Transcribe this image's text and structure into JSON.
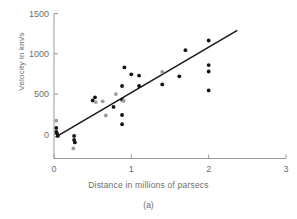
{
  "figure": {
    "caption": "(a)",
    "xlabel": "Distance in millions of parsecs",
    "ylabel": "Velocity in km/s"
  },
  "chart_data": {
    "type": "scatter",
    "title": "",
    "xlabel": "Distance in millions of parsecs",
    "ylabel": "Velocity in km/s",
    "xlim": [
      0,
      3
    ],
    "ylim": [
      -300,
      1500
    ],
    "xticks": [
      0,
      1,
      2,
      3
    ],
    "xticklabels": [
      "0",
      "1",
      "2",
      "3"
    ],
    "yticks": [
      0,
      500,
      1000,
      1500
    ],
    "yticklabels": [
      "0",
      "500",
      "1000",
      "1500"
    ],
    "grid": false,
    "legend": null,
    "axis_color": "#999999",
    "point_color": "#111111",
    "point_color_light": "#9a9a9a",
    "line_color": "#1a1a1a",
    "points": [
      {
        "x": 0.03,
        "y": 170,
        "shade": "light"
      },
      {
        "x": 0.03,
        "y": 80,
        "shade": "dark"
      },
      {
        "x": 0.03,
        "y": 30,
        "shade": "dark"
      },
      {
        "x": 0.04,
        "y": 10,
        "shade": "dark"
      },
      {
        "x": 0.05,
        "y": -20,
        "shade": "dark"
      },
      {
        "x": 0.26,
        "y": -20,
        "shade": "dark"
      },
      {
        "x": 0.26,
        "y": -70,
        "shade": "dark"
      },
      {
        "x": 0.27,
        "y": -100,
        "shade": "dark"
      },
      {
        "x": 0.25,
        "y": -175,
        "shade": "light"
      },
      {
        "x": 0.5,
        "y": 420,
        "shade": "dark"
      },
      {
        "x": 0.53,
        "y": 460,
        "shade": "dark"
      },
      {
        "x": 0.54,
        "y": 400,
        "shade": "light"
      },
      {
        "x": 0.63,
        "y": 410,
        "shade": "light"
      },
      {
        "x": 0.67,
        "y": 235,
        "shade": "light"
      },
      {
        "x": 0.77,
        "y": 340,
        "shade": "dark"
      },
      {
        "x": 0.8,
        "y": 500,
        "shade": "light"
      },
      {
        "x": 0.88,
        "y": 600,
        "shade": "dark"
      },
      {
        "x": 0.88,
        "y": 430,
        "shade": "dark"
      },
      {
        "x": 0.9,
        "y": 415,
        "shade": "light"
      },
      {
        "x": 0.88,
        "y": 240,
        "shade": "dark"
      },
      {
        "x": 0.88,
        "y": 125,
        "shade": "dark"
      },
      {
        "x": 0.91,
        "y": 830,
        "shade": "dark"
      },
      {
        "x": 1.0,
        "y": 745,
        "shade": "dark"
      },
      {
        "x": 1.1,
        "y": 730,
        "shade": "dark"
      },
      {
        "x": 1.1,
        "y": 600,
        "shade": "dark"
      },
      {
        "x": 1.4,
        "y": 775,
        "shade": "light"
      },
      {
        "x": 1.4,
        "y": 620,
        "shade": "dark"
      },
      {
        "x": 1.62,
        "y": 720,
        "shade": "dark"
      },
      {
        "x": 1.7,
        "y": 1045,
        "shade": "dark"
      },
      {
        "x": 2.0,
        "y": 1165,
        "shade": "dark"
      },
      {
        "x": 2.0,
        "y": 860,
        "shade": "dark"
      },
      {
        "x": 2.0,
        "y": 780,
        "shade": "dark"
      },
      {
        "x": 2.0,
        "y": 545,
        "shade": "dark"
      }
    ],
    "fit_line": {
      "x_start": 0.02,
      "y_start": -35,
      "x_end": 2.37,
      "y_end": 1290
    }
  }
}
